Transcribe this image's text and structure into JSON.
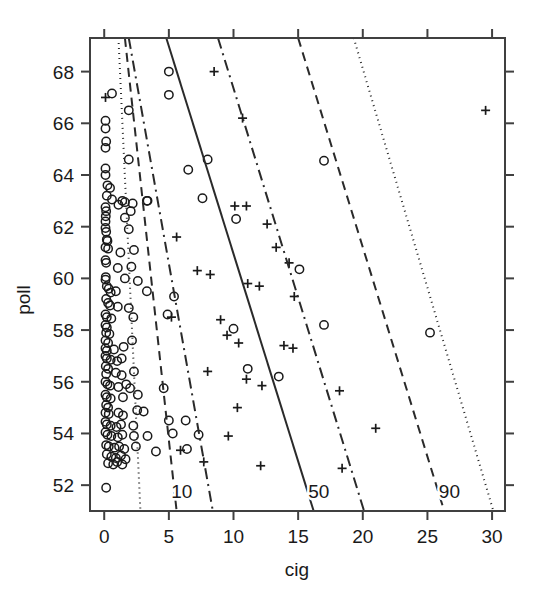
{
  "figure": {
    "background": "#ffffff",
    "foreground": "#1a1a1a"
  },
  "axes": {
    "x_title": "cig",
    "y_title": "poll",
    "x_ticks": [
      "0",
      "5",
      "10",
      "15",
      "20",
      "25",
      "30"
    ],
    "y_ticks": [
      "52",
      "54",
      "56",
      "58",
      "60",
      "62",
      "64",
      "66",
      "68"
    ]
  },
  "line_labels": {
    "q10": "10",
    "q50": "50",
    "q90": "90"
  },
  "chart_data": {
    "type": "scatter",
    "title": "",
    "xlabel": "cig",
    "ylabel": "poll",
    "xlim": [
      -1.1,
      31.0
    ],
    "ylim": [
      51.0,
      69.3
    ],
    "xticks": [
      0,
      5,
      10,
      15,
      20,
      25,
      30
    ],
    "yticks": [
      52,
      54,
      56,
      58,
      60,
      62,
      64,
      66,
      68
    ],
    "grid": false,
    "legend": "none",
    "series": [
      {
        "name": "circle-points",
        "marker": "circle",
        "color": "#1a1a1a",
        "points": [
          [
            5.0,
            68.0
          ],
          [
            5.0,
            67.1
          ],
          [
            0.6,
            67.15
          ],
          [
            1.9,
            66.5
          ],
          [
            0.1,
            66.1
          ],
          [
            0.1,
            65.8
          ],
          [
            0.15,
            65.3
          ],
          [
            0.1,
            65.05
          ],
          [
            1.9,
            64.6
          ],
          [
            0.1,
            64.25
          ],
          [
            0.1,
            64.0
          ],
          [
            0.25,
            63.6
          ],
          [
            0.45,
            63.5
          ],
          [
            8.0,
            64.6
          ],
          [
            6.5,
            64.2
          ],
          [
            0.2,
            63.2
          ],
          [
            0.6,
            63.05
          ],
          [
            1.4,
            63.0
          ],
          [
            1.6,
            62.95
          ],
          [
            2.2,
            62.9
          ],
          [
            3.3,
            63.0
          ],
          [
            3.35,
            63.0
          ],
          [
            17.0,
            64.55
          ],
          [
            0.1,
            62.75
          ],
          [
            0.15,
            62.6
          ],
          [
            1.1,
            62.85
          ],
          [
            2.05,
            62.6
          ],
          [
            0.12,
            62.4
          ],
          [
            0.1,
            62.2
          ],
          [
            1.6,
            62.35
          ],
          [
            7.6,
            63.1
          ],
          [
            0.1,
            61.95
          ],
          [
            0.15,
            61.8
          ],
          [
            1.9,
            61.9
          ],
          [
            10.2,
            62.3
          ],
          [
            0.2,
            61.5
          ],
          [
            0.25,
            61.45
          ],
          [
            0.1,
            61.2
          ],
          [
            0.3,
            61.15
          ],
          [
            1.25,
            61.0
          ],
          [
            2.3,
            61.1
          ],
          [
            0.1,
            60.7
          ],
          [
            0.15,
            60.6
          ],
          [
            1.05,
            60.4
          ],
          [
            2.1,
            60.45
          ],
          [
            15.1,
            60.35
          ],
          [
            0.12,
            60.05
          ],
          [
            0.1,
            59.95
          ],
          [
            1.6,
            60.0
          ],
          [
            0.2,
            59.7
          ],
          [
            0.35,
            59.6
          ],
          [
            0.5,
            59.45
          ],
          [
            0.9,
            59.5
          ],
          [
            2.6,
            59.9
          ],
          [
            3.3,
            59.5
          ],
          [
            5.4,
            59.3
          ],
          [
            0.15,
            59.2
          ],
          [
            0.3,
            59.05
          ],
          [
            0.45,
            58.95
          ],
          [
            1.05,
            58.9
          ],
          [
            1.9,
            58.85
          ],
          [
            0.1,
            58.6
          ],
          [
            0.2,
            58.5
          ],
          [
            0.55,
            58.45
          ],
          [
            2.25,
            58.5
          ],
          [
            4.9,
            58.6
          ],
          [
            0.1,
            58.2
          ],
          [
            0.2,
            58.1
          ],
          [
            0.15,
            57.9
          ],
          [
            0.4,
            57.85
          ],
          [
            0.1,
            57.6
          ],
          [
            0.3,
            57.5
          ],
          [
            0.1,
            57.3
          ],
          [
            0.2,
            57.2
          ],
          [
            0.75,
            57.25
          ],
          [
            1.5,
            57.35
          ],
          [
            2.15,
            57.6
          ],
          [
            10.0,
            58.05
          ],
          [
            17.0,
            58.2
          ],
          [
            25.2,
            57.9
          ],
          [
            0.1,
            57.0
          ],
          [
            0.2,
            56.9
          ],
          [
            0.5,
            56.85
          ],
          [
            1.0,
            56.8
          ],
          [
            1.35,
            56.9
          ],
          [
            0.12,
            56.6
          ],
          [
            0.3,
            56.5
          ],
          [
            0.15,
            56.3
          ],
          [
            0.9,
            56.35
          ],
          [
            1.35,
            56.25
          ],
          [
            2.3,
            56.4
          ],
          [
            11.1,
            56.5
          ],
          [
            13.5,
            56.2
          ],
          [
            0.1,
            56.0
          ],
          [
            0.25,
            55.9
          ],
          [
            0.45,
            55.85
          ],
          [
            1.1,
            55.8
          ],
          [
            1.7,
            55.9
          ],
          [
            2.0,
            55.75
          ],
          [
            4.6,
            55.75
          ],
          [
            0.1,
            55.5
          ],
          [
            0.2,
            55.4
          ],
          [
            0.5,
            55.35
          ],
          [
            1.45,
            55.4
          ],
          [
            2.6,
            55.5
          ],
          [
            0.15,
            55.1
          ],
          [
            0.3,
            55.0
          ],
          [
            0.1,
            54.8
          ],
          [
            0.35,
            54.75
          ],
          [
            1.1,
            54.8
          ],
          [
            1.45,
            54.7
          ],
          [
            2.55,
            54.9
          ],
          [
            3.05,
            54.85
          ],
          [
            0.1,
            54.45
          ],
          [
            0.2,
            54.35
          ],
          [
            0.5,
            54.3
          ],
          [
            0.95,
            54.25
          ],
          [
            1.3,
            54.35
          ],
          [
            2.25,
            54.3
          ],
          [
            5.0,
            54.5
          ],
          [
            6.3,
            54.5
          ],
          [
            0.1,
            54.05
          ],
          [
            0.25,
            53.95
          ],
          [
            0.55,
            53.9
          ],
          [
            1.05,
            53.85
          ],
          [
            1.4,
            53.95
          ],
          [
            2.3,
            53.9
          ],
          [
            3.35,
            53.9
          ],
          [
            5.3,
            54.0
          ],
          [
            7.3,
            53.95
          ],
          [
            0.15,
            53.55
          ],
          [
            0.35,
            53.5
          ],
          [
            0.8,
            53.45
          ],
          [
            1.15,
            53.5
          ],
          [
            1.55,
            53.4
          ],
          [
            2.45,
            53.5
          ],
          [
            4.0,
            53.3
          ],
          [
            6.4,
            53.4
          ],
          [
            0.2,
            53.2
          ],
          [
            0.55,
            53.1
          ],
          [
            0.9,
            53.05
          ],
          [
            1.3,
            53.15
          ],
          [
            1.65,
            53.0
          ],
          [
            0.3,
            52.85
          ],
          [
            0.7,
            52.8
          ],
          [
            1.0,
            52.9
          ],
          [
            1.4,
            52.8
          ],
          [
            0.15,
            51.9
          ]
        ]
      },
      {
        "name": "plus-points",
        "marker": "plus",
        "color": "#1a1a1a",
        "points": [
          [
            0.1,
            67.0
          ],
          [
            8.5,
            68.0
          ],
          [
            10.7,
            66.2
          ],
          [
            29.5,
            66.5
          ],
          [
            10.1,
            62.8
          ],
          [
            11.0,
            62.8
          ],
          [
            12.6,
            62.1
          ],
          [
            5.6,
            61.6
          ],
          [
            13.3,
            61.2
          ],
          [
            14.3,
            60.6
          ],
          [
            7.2,
            60.3
          ],
          [
            8.2,
            60.15
          ],
          [
            11.1,
            59.8
          ],
          [
            12.0,
            59.7
          ],
          [
            14.7,
            59.3
          ],
          [
            5.2,
            58.5
          ],
          [
            9.0,
            58.4
          ],
          [
            9.5,
            57.8
          ],
          [
            10.4,
            57.5
          ],
          [
            13.9,
            57.4
          ],
          [
            14.6,
            57.3
          ],
          [
            8.0,
            56.4
          ],
          [
            11.0,
            56.1
          ],
          [
            12.2,
            55.85
          ],
          [
            18.2,
            55.65
          ],
          [
            10.3,
            55.0
          ],
          [
            21.0,
            54.2
          ],
          [
            9.6,
            53.9
          ],
          [
            5.9,
            53.35
          ],
          [
            7.7,
            52.9
          ],
          [
            12.1,
            52.75
          ],
          [
            18.4,
            52.65
          ]
        ]
      }
    ],
    "quantile_lines": [
      {
        "name": "q05",
        "label": "",
        "style": "dotted",
        "x1": 1.1,
        "y1": 69.3,
        "x2": 2.8,
        "y2": 51.0
      },
      {
        "name": "q10",
        "label": "10",
        "style": "dashed",
        "x1": 1.6,
        "y1": 69.3,
        "x2": 5.6,
        "y2": 51.0
      },
      {
        "name": "q25",
        "label": "",
        "style": "dashdot",
        "x1": 1.9,
        "y1": 69.3,
        "x2": 8.4,
        "y2": 51.0
      },
      {
        "name": "q50",
        "label": "50",
        "style": "solid",
        "x1": 4.8,
        "y1": 69.3,
        "x2": 16.2,
        "y2": 51.0
      },
      {
        "name": "q75",
        "label": "",
        "style": "dashdot",
        "x1": 8.8,
        "y1": 69.3,
        "x2": 20.1,
        "y2": 51.0
      },
      {
        "name": "q90",
        "label": "90",
        "style": "dashed",
        "x1": 15.0,
        "y1": 69.3,
        "x2": 26.3,
        "y2": 51.0
      },
      {
        "name": "q95",
        "label": "",
        "style": "dotted",
        "x1": 19.3,
        "y1": 69.3,
        "x2": 30.1,
        "y2": 51.0
      }
    ],
    "line_label_positions": [
      {
        "label": "10",
        "x": 6.0,
        "y": 51.5
      },
      {
        "label": "50",
        "x": 16.6,
        "y": 51.5
      },
      {
        "label": "90",
        "x": 26.7,
        "y": 51.5
      }
    ]
  }
}
